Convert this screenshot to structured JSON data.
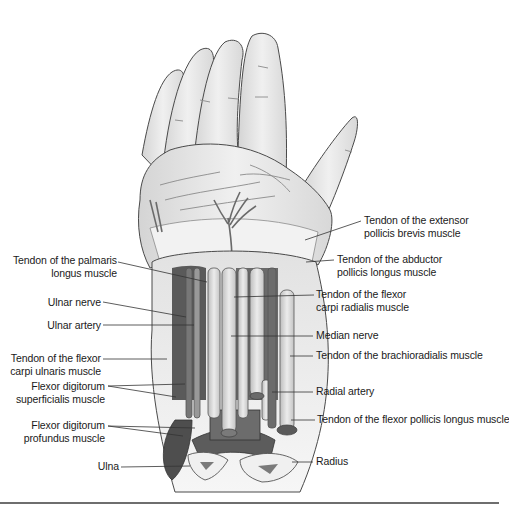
{
  "figure": {
    "colors": {
      "skin": "#e6e6e6",
      "skin_outline": "#4a4a4a",
      "muscle_dark": "#555555",
      "muscle_mid": "#7a7a7a",
      "tendon": "#d9d9d9",
      "bone": "#eeeeee",
      "marrow": "#7a7a7a",
      "rule": "#6e6e6e"
    }
  },
  "labels_left": [
    {
      "id": "palmaris",
      "line1": "Tendon of the palmaris",
      "line2": "longus muscle"
    },
    {
      "id": "ulnar-nerve",
      "line1": "Ulnar nerve"
    },
    {
      "id": "ulnar-artery",
      "line1": "Ulnar artery"
    },
    {
      "id": "fcu",
      "line1": "Tendon of the flexor",
      "line2": "carpi ulnaris muscle"
    },
    {
      "id": "fds",
      "line1": "Flexor digitorum",
      "line2": "superficialis muscle"
    },
    {
      "id": "fdp",
      "line1": "Flexor digitorum",
      "line2": "profundus muscle"
    },
    {
      "id": "ulna",
      "line1": "Ulna"
    }
  ],
  "labels_right": [
    {
      "id": "epb",
      "line1": "Tendon of the extensor",
      "line2": "pollicis brevis muscle"
    },
    {
      "id": "apl",
      "line1": "Tendon of the abductor",
      "line2": "pollicis longus muscle"
    },
    {
      "id": "fcr",
      "line1": "Tendon of the flexor",
      "line2": "carpi radialis muscle"
    },
    {
      "id": "median-nerve",
      "line1": "Median nerve"
    },
    {
      "id": "brachioradialis",
      "line1": "Tendon of the brachioradialis muscle"
    },
    {
      "id": "radial-artery",
      "line1": "Radial artery"
    },
    {
      "id": "fpl",
      "line1": "Tendon of the flexor pollicis longus muscle"
    },
    {
      "id": "radius",
      "line1": "Radius"
    }
  ]
}
